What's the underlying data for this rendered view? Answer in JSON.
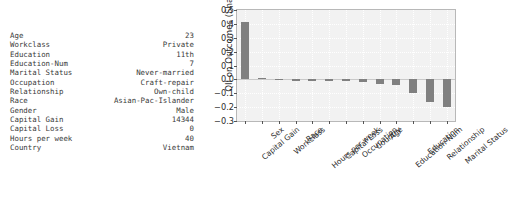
{
  "record": {
    "rows": [
      {
        "key": "Age",
        "value": "23"
      },
      {
        "key": "Workclass",
        "value": "Private"
      },
      {
        "key": "Education",
        "value": "11th"
      },
      {
        "key": "Education-Num",
        "value": "7"
      },
      {
        "key": "Marital Status",
        "value": "Never-married"
      },
      {
        "key": "Occupation",
        "value": "Craft-repair"
      },
      {
        "key": "Relationship",
        "value": "Own-child"
      },
      {
        "key": "Race",
        "value": "Asian-Pac-Islander"
      },
      {
        "key": "Gender",
        "value": "Male"
      },
      {
        "key": "Capital Gain",
        "value": "14344"
      },
      {
        "key": "Capital Loss",
        "value": "0"
      },
      {
        "key": "Hours per week",
        "value": "40"
      },
      {
        "key": "Country",
        "value": "Vietnam"
      }
    ]
  },
  "chart_data": {
    "type": "bar",
    "title": "",
    "xlabel": "",
    "ylabel": "QII on Outcomes (Shapley)",
    "ylim": [
      -0.3,
      0.5
    ],
    "yticks": [
      0.5,
      0.4,
      0.3,
      0.2,
      0.1,
      0.0,
      -0.1,
      -0.2,
      -0.3
    ],
    "ytick_labels": [
      "0.5",
      "0.4",
      "0.3",
      "0.2",
      "0.1",
      "0.0",
      "−0.1",
      "−0.2",
      "−0.3"
    ],
    "grid": true,
    "legend": null,
    "bar_color": "#808080",
    "categories": [
      "Capital Gain",
      "Sex",
      "Workclass",
      "Race",
      "Hours per week",
      "Capital Loss",
      "Occupation",
      "Country",
      "Age",
      "Education-Num",
      "Education",
      "Relationship",
      "Marital Status"
    ],
    "values": [
      0.412,
      0.013,
      0.004,
      0.0,
      -0.006,
      -0.005,
      -0.008,
      -0.017,
      -0.034,
      -0.042,
      -0.097,
      -0.166,
      -0.197
    ]
  }
}
